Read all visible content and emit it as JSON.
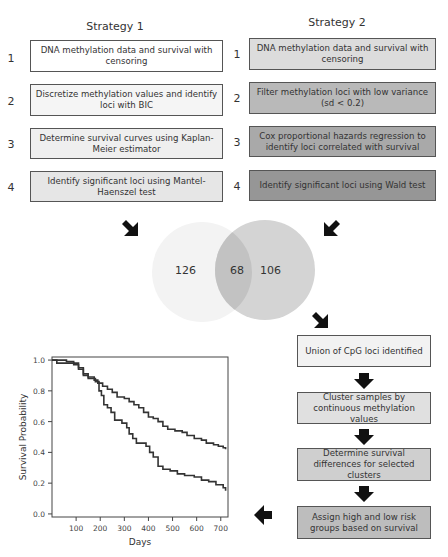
{
  "strategy1": {
    "title": "Strategy 1",
    "steps": [
      {
        "num": "1",
        "text": "DNA methylation data and survival with censoring",
        "fill": "#ffffff"
      },
      {
        "num": "2",
        "text": "Discretize methylation values and identify loci with BIC",
        "fill": "#f5f5f5"
      },
      {
        "num": "3",
        "text": "Determine survival curves using Kaplan-Meier estimator",
        "fill": "#efefef"
      },
      {
        "num": "4",
        "text": "Identify significant loci using Mantel-Haenszel test",
        "fill": "#e6e6e6"
      }
    ]
  },
  "strategy2": {
    "title": "Strategy 2",
    "steps": [
      {
        "num": "1",
        "text": "DNA methylation data and survival with censoring",
        "fill": "#dcdcdc"
      },
      {
        "num": "2",
        "text": "Filter methylation loci with low variance (sd < 0.2)",
        "fill": "#b9b9b9"
      },
      {
        "num": "3",
        "text": "Cox proportional hazards regression to identify loci correlated with survival",
        "fill": "#a9a9a9"
      },
      {
        "num": "4",
        "text": "Identify significant loci using Wald test",
        "fill": "#969696"
      }
    ]
  },
  "venn": {
    "left_only": "126",
    "overlap": "68",
    "right_only": "106",
    "left_color": "#f3f3f3",
    "right_color": "#d4d4d4",
    "overlap_color": "#c2c2c2"
  },
  "flow": {
    "steps": [
      {
        "text": "Union of CpG loci identified",
        "fill": "#f2f2f2"
      },
      {
        "text": "Cluster samples by continuous methylation values",
        "fill": "#e0e0e0"
      },
      {
        "text": "Determine survival differences for selected clusters",
        "fill": "#cfcfcf"
      },
      {
        "text": "Assign high and low risk groups based on survival",
        "fill": "#bdbdbd"
      }
    ]
  },
  "chart_data": {
    "type": "line",
    "title": "",
    "xlabel": "Days",
    "ylabel": "Survival Probability",
    "xlim": [
      0,
      730
    ],
    "ylim": [
      0,
      1.0
    ],
    "xticks": [
      100,
      200,
      300,
      400,
      500,
      600,
      700
    ],
    "yticks": [
      "0.0",
      "0.2",
      "0.4",
      "0.6",
      "0.8",
      "1.0"
    ],
    "grid": false,
    "series": [
      {
        "name": "low risk",
        "step": true,
        "points": [
          [
            0,
            1.0
          ],
          [
            40,
            1.0
          ],
          [
            60,
            0.99
          ],
          [
            90,
            0.98
          ],
          [
            110,
            0.95
          ],
          [
            130,
            0.91
          ],
          [
            150,
            0.89
          ],
          [
            175,
            0.87
          ],
          [
            190,
            0.85
          ],
          [
            210,
            0.83
          ],
          [
            230,
            0.81
          ],
          [
            250,
            0.79
          ],
          [
            270,
            0.76
          ],
          [
            300,
            0.75
          ],
          [
            320,
            0.73
          ],
          [
            340,
            0.71
          ],
          [
            360,
            0.69
          ],
          [
            380,
            0.66
          ],
          [
            400,
            0.63
          ],
          [
            420,
            0.62
          ],
          [
            440,
            0.6
          ],
          [
            460,
            0.57
          ],
          [
            480,
            0.55
          ],
          [
            510,
            0.54
          ],
          [
            540,
            0.53
          ],
          [
            560,
            0.51
          ],
          [
            590,
            0.49
          ],
          [
            620,
            0.48
          ],
          [
            640,
            0.46
          ],
          [
            670,
            0.45
          ],
          [
            690,
            0.44
          ],
          [
            710,
            0.43
          ],
          [
            720,
            0.42
          ]
        ]
      },
      {
        "name": "high risk",
        "step": true,
        "points": [
          [
            0,
            1.0
          ],
          [
            20,
            0.98
          ],
          [
            60,
            0.98
          ],
          [
            90,
            0.97
          ],
          [
            110,
            0.94
          ],
          [
            130,
            0.9
          ],
          [
            150,
            0.88
          ],
          [
            180,
            0.86
          ],
          [
            195,
            0.8
          ],
          [
            205,
            0.77
          ],
          [
            215,
            0.71
          ],
          [
            230,
            0.69
          ],
          [
            245,
            0.66
          ],
          [
            260,
            0.61
          ],
          [
            290,
            0.59
          ],
          [
            310,
            0.56
          ],
          [
            320,
            0.52
          ],
          [
            335,
            0.49
          ],
          [
            350,
            0.46
          ],
          [
            390,
            0.44
          ],
          [
            405,
            0.4
          ],
          [
            420,
            0.37
          ],
          [
            440,
            0.31
          ],
          [
            460,
            0.29
          ],
          [
            490,
            0.28
          ],
          [
            520,
            0.26
          ],
          [
            550,
            0.25
          ],
          [
            590,
            0.24
          ],
          [
            620,
            0.22
          ],
          [
            650,
            0.21
          ],
          [
            680,
            0.19
          ],
          [
            710,
            0.17
          ],
          [
            720,
            0.15
          ]
        ]
      }
    ]
  },
  "chart_labels": {
    "xlabel": "Days",
    "ylabel": "Survival Probability"
  }
}
